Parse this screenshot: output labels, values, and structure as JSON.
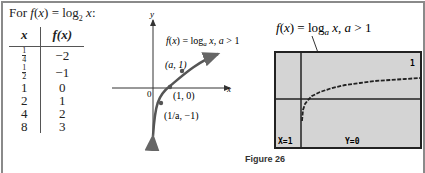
{
  "title": {
    "prefix": "For ",
    "func": "f(x) = log",
    "sub": "2",
    "suffix": " x:"
  },
  "table": {
    "headers": [
      "x",
      "f(x)"
    ],
    "rows": [
      {
        "x": "1/4",
        "fx": "−2"
      },
      {
        "x": "1/2",
        "fx": "−1"
      },
      {
        "x": "1",
        "fx": "0"
      },
      {
        "x": "2",
        "fx": "1"
      },
      {
        "x": "4",
        "fx": "2"
      },
      {
        "x": "8",
        "fx": "3"
      }
    ]
  },
  "graph": {
    "y_label": "y",
    "x_label": "x",
    "origin_label": "0",
    "func_label": "f(x) = log_a x, a > 1",
    "points": [
      {
        "label": "(a, 1)"
      },
      {
        "label": "(1, 0)"
      },
      {
        "label": "(1/a, −1)"
      }
    ]
  },
  "calculator": {
    "annotation": "f(x) = log_a x, a > 1",
    "indicator": "1",
    "x_readout": "X=1",
    "y_readout": "Y=0",
    "screen_color": "#d4d4d4"
  },
  "caption": "Figure 26"
}
